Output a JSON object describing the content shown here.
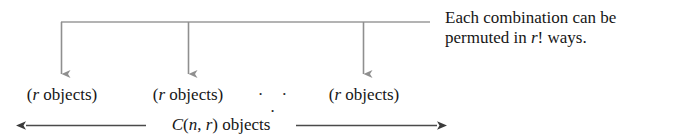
{
  "diagram": {
    "type": "bracket-arrow-diagram",
    "colors": {
      "bracket_line": "#9a9a9a",
      "arrow_line": "#8f8f8f",
      "measure_line": "#4a4a4a",
      "text": "#161616",
      "background": "#ffffff"
    },
    "groups": [
      {
        "prefix": "(",
        "variable": "r",
        "noun": " objects",
        "suffix": ")"
      },
      {
        "prefix": "(",
        "variable": "r",
        "noun": " objects",
        "suffix": ")"
      },
      {
        "prefix": "(",
        "variable": "r",
        "noun": " objects",
        "suffix": ")"
      }
    ],
    "ellipsis": "· · ·",
    "total_measure": {
      "function": "C",
      "open_paren": "(",
      "arg1": "n",
      "comma": ", ",
      "arg2": "r",
      "close_paren": ")",
      "noun": " objects"
    },
    "annotation": {
      "line1": "Each combination can be",
      "line2_before": "permuted in ",
      "line2_variable": "r",
      "line2_after": "! ways."
    }
  }
}
